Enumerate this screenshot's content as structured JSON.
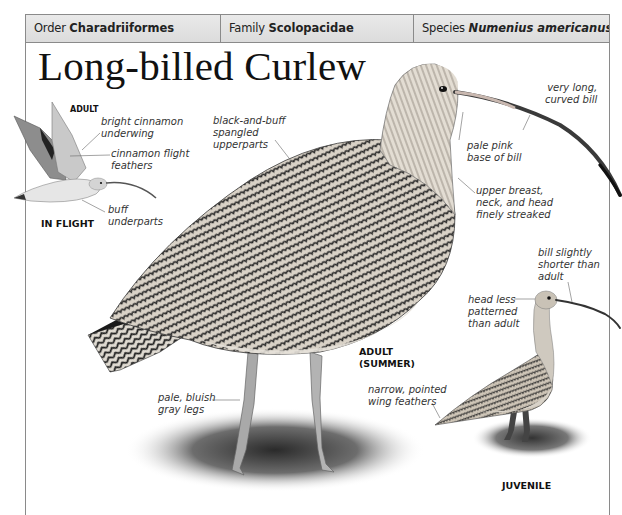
{
  "header": {
    "order": {
      "key": "Order",
      "value": "Charadriiformes"
    },
    "family": {
      "key": "Family",
      "value": "Scolopacidae"
    },
    "species": {
      "key": "Species",
      "value": "Numenius americanus"
    }
  },
  "title": "Long-billed Curlew",
  "figures": {
    "in_flight": {
      "caption_top": "ADULT",
      "caption_bottom": "IN FLIGHT",
      "labels": {
        "underwing": "bright cinnamon\nunderwing",
        "flight_feathers": "cinnamon flight\nfeathers",
        "underparts": "buff\nunderparts"
      }
    },
    "adult_summer": {
      "caption": "ADULT\n(SUMMER)",
      "labels": {
        "upperparts": "black-and-buff\nspangled\nupperparts",
        "bill": "very long,\ncurved bill",
        "bill_base": "pale pink\nbase of bill",
        "breast": "upper breast,\nneck, and head\nfinely streaked",
        "legs": "pale, bluish\ngray legs"
      }
    },
    "juvenile": {
      "caption": "JUVENILE",
      "labels": {
        "bill": "bill slightly\nshorter than\nadult",
        "head": "head less\npatterned\nthan adult",
        "wing": "narrow, pointed\nwing feathers"
      }
    }
  },
  "colors": {
    "border": "#8a8a8a",
    "header_bg": "#e2e2e2",
    "text": "#222222"
  }
}
